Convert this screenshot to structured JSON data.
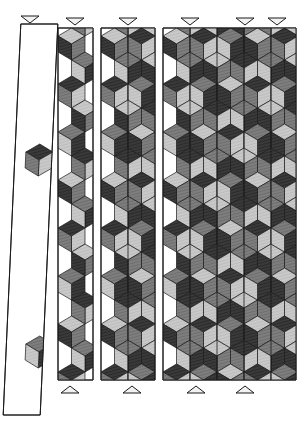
{
  "figure": {
    "type": "rhombille-tiling-diagram",
    "canvas": {
      "width": 304,
      "height": 435,
      "background": "#ffffff"
    },
    "palette": {
      "cube_top_light": "#c9c9c9",
      "cube_left_dark": "#3a3a3a",
      "cube_right_mid": "#7e7e7e",
      "outline": "#1a1a1a",
      "panel_fill": "#ffffff",
      "marker_fill": "#f2f2f2",
      "marker_stroke": "#1a1a1a"
    },
    "rhombus": {
      "half_width": 13.5,
      "half_height": 8.0,
      "note": "60-degree rhombi forming cubes"
    }
  },
  "panels": [
    {
      "id": "panel-1",
      "name": "sparse-skewed-panel",
      "x": 12,
      "y": 24,
      "width": 37,
      "height": 391,
      "columns": 1,
      "skew": -0.045,
      "density": "sparse",
      "cube_rows": [
        5,
        13,
        22,
        31,
        39
      ],
      "marker_top": {
        "x": 30,
        "y": 16,
        "direction": "down"
      },
      "marker_bottom": null
    },
    {
      "id": "panel-2",
      "name": "single-column-panel",
      "x": 58,
      "y": 28,
      "width": 35,
      "height": 352,
      "columns": 1,
      "skew": 0,
      "density": "full",
      "marker_top": {
        "x": 75,
        "y": 18,
        "direction": "down"
      },
      "marker_bottom": {
        "x": 70,
        "y": 384,
        "direction": "up"
      }
    },
    {
      "id": "panel-3",
      "name": "double-column-panel",
      "x": 101,
      "y": 28,
      "width": 54,
      "height": 352,
      "columns": 2,
      "skew": 0,
      "density": "full",
      "marker_top": {
        "x": 128,
        "y": 18,
        "direction": "down"
      },
      "marker_bottom": {
        "x": 132,
        "y": 384,
        "direction": "up"
      }
    },
    {
      "id": "panel-4",
      "name": "wide-multi-column-panel",
      "x": 163,
      "y": 28,
      "width": 133,
      "height": 352,
      "columns": 5,
      "skew": 0,
      "density": "full",
      "marker_top": {
        "x": 190,
        "y": 18,
        "direction": "down"
      },
      "marker_bottom": {
        "x": 196,
        "y": 384,
        "direction": "up"
      }
    }
  ],
  "markers": {
    "top": [
      {
        "id": "marker-top-1",
        "x": 30,
        "y": 16,
        "direction": "down"
      },
      {
        "id": "marker-top-2",
        "x": 75,
        "y": 18,
        "direction": "down"
      },
      {
        "id": "marker-top-3",
        "x": 128,
        "y": 18,
        "direction": "down"
      },
      {
        "id": "marker-top-4",
        "x": 190,
        "y": 18,
        "direction": "down"
      },
      {
        "id": "marker-top-5",
        "x": 245,
        "y": 18,
        "direction": "down"
      },
      {
        "id": "marker-top-6",
        "x": 277,
        "y": 18,
        "direction": "down"
      }
    ],
    "bottom": [
      {
        "id": "marker-bottom-1",
        "x": 70,
        "y": 386,
        "direction": "up"
      },
      {
        "id": "marker-bottom-2",
        "x": 132,
        "y": 386,
        "direction": "up"
      },
      {
        "id": "marker-bottom-3",
        "x": 196,
        "y": 386,
        "direction": "up"
      },
      {
        "id": "marker-bottom-4",
        "x": 245,
        "y": 386,
        "direction": "up"
      }
    ],
    "size": {
      "half_width": 9,
      "height": 7
    }
  },
  "chart_data": {
    "type": "diagram",
    "panel_widths": [
      37,
      35,
      54,
      133
    ],
    "panel_columns": [
      1,
      1,
      2,
      5
    ],
    "shade_values": [
      "#3a3a3a",
      "#7e7e7e",
      "#c9c9c9"
    ],
    "marker_counts": {
      "top": 6,
      "bottom": 4
    }
  }
}
